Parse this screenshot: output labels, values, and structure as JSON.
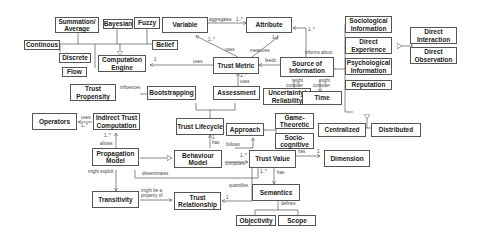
{
  "nodes": {
    "summation": "Summation/ Average",
    "bayesian": "Bayesian",
    "fuzzy": "Fuzzy",
    "continous": "Continous",
    "discrete": "Discrete",
    "flow": "Flow",
    "computation_engine": "Computation Engine",
    "variable": "Variable",
    "belief": "Belief",
    "attribute": "Attribute",
    "trust_metric": "Trust Metric",
    "source_info": "Source of Information",
    "sociological": "Sociological Information",
    "direct_experience": "Direct Experience",
    "psychological": "Psychological Information",
    "reputation": "Reputation",
    "direct_interaction": "Direct Interaction",
    "direct_observation": "Direct Observation",
    "trust_propensity": "Trust Propensity",
    "bootstrapping": "Bootstrapping",
    "assessment": "Assessment",
    "uncertainty": "Uncertainty/ Reliability",
    "time": "Time",
    "centralized": "Centralized",
    "distributed": "Distributed",
    "operators": "Operators",
    "indirect_trust": "Indirect Trust Computation",
    "trust_lifecycle": "Trust Lifecycle",
    "approach": "Approach",
    "game_theoretic": "Game-Theoretic",
    "socio_cognitive": "Socio-cognitive",
    "propagation_model": "Propagation Model",
    "behaviour_model": "Behaviour Model",
    "trust_value": "Trust Value",
    "dimension": "Dimension",
    "semantics": "Semantics",
    "transitivity": "Transitivity",
    "trust_relationship": "Trust Relationship",
    "objectivity": "Objectivity",
    "scope": "Scope"
  },
  "edges": {
    "aggregates": "aggregates",
    "aggregates_mult": "1..*",
    "uses_var": "uses",
    "uses_var_mult": "1..*",
    "measures": "measures",
    "attr_mult": "1..*",
    "uses_engine": "uses",
    "engine_mult": "1",
    "feeds": "feeds",
    "informs_about": "informs about",
    "informs_mult": "1..*",
    "might_consider_1": "might consider",
    "might_consider_2": "might consider",
    "influences": "influences",
    "uses_assess": "uses",
    "assess_mult": "1..*",
    "uses_ops": "uses",
    "ops_mult": "1..*",
    "allows": "allows",
    "allows_mult": "1..*",
    "has_lifecycle": "has",
    "has_lifecycle_mult": "1",
    "follows": "follows",
    "computes": "computes",
    "computes_mult": "1..*",
    "has_dim": "has",
    "has_dim_mult": "1",
    "has_sem": "has",
    "sem_mult": "1..*",
    "disseminates": "disseminates",
    "might_exploit": "might exploit",
    "might_be_property": "might be a property of",
    "quantifies": "quantifies",
    "quantifies_mult": "1",
    "defines": "defines"
  }
}
